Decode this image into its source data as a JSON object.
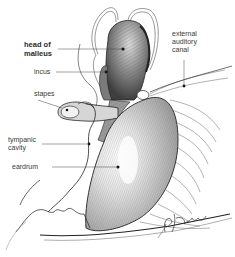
{
  "figure": {
    "style": "pen-and-ink line drawing",
    "colors": {
      "background": "#ffffff",
      "ink": "#2a2a2a",
      "label_text": "#3a3a3a"
    }
  },
  "labels": {
    "head_of_malleus": "head of\nmalleus",
    "incus": "incus",
    "stapes": "stapes",
    "tympanic_cavity": "tympanic\ncavity",
    "eardrum": "eardrum",
    "external_auditory_canal": "external\nauditory\ncanal"
  },
  "signature": "B. Tallon"
}
